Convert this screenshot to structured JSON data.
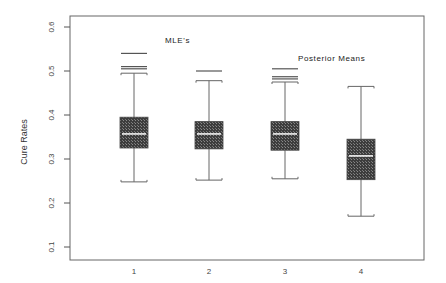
{
  "chart_data": {
    "type": "boxplot",
    "title": "",
    "xlabel": "",
    "ylabel": "Cure Rates",
    "ylim": [
      0.1,
      0.6
    ],
    "yticks": [
      0.1,
      0.2,
      0.3,
      0.4,
      0.5,
      0.6
    ],
    "ytick_labels": [
      "0.1",
      "0.2",
      "0.3",
      "0.4",
      "0.5",
      "0.6"
    ],
    "categories": [
      "1",
      "2",
      "3",
      "4"
    ],
    "grid": false,
    "annotations": [
      {
        "text": "MLE's",
        "x_near": "1",
        "y": 0.575
      },
      {
        "text": "Posterior Means",
        "x_near": "3-4",
        "y": 0.525
      }
    ],
    "boxes": [
      {
        "label": "1",
        "whisker_low": 0.248,
        "q1": 0.325,
        "median": 0.357,
        "q3": 0.395,
        "whisker_high": 0.495,
        "outliers": [
          0.505,
          0.51,
          0.54
        ]
      },
      {
        "label": "2",
        "whisker_low": 0.252,
        "q1": 0.323,
        "median": 0.357,
        "q3": 0.385,
        "whisker_high": 0.478,
        "outliers": [
          0.5
        ]
      },
      {
        "label": "3",
        "whisker_low": 0.255,
        "q1": 0.32,
        "median": 0.357,
        "q3": 0.385,
        "whisker_high": 0.475,
        "outliers": [
          0.482,
          0.487,
          0.505
        ]
      },
      {
        "label": "4",
        "whisker_low": 0.17,
        "q1": 0.253,
        "median": 0.307,
        "q3": 0.345,
        "whisker_high": 0.465,
        "outliers": []
      }
    ],
    "colors": {
      "box_fill": "#4a4a4a",
      "median_line": "#ffffff",
      "frame": "#555555"
    }
  }
}
